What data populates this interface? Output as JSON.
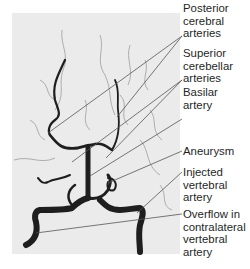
{
  "figure": {
    "image_description": "Cerebral angiogram (vertebral artery injection), grayscale",
    "background_color": "#ebebeb",
    "vessel_color": "#1a1a1a",
    "leader_line_color": "#555555",
    "labels": [
      {
        "id": "posterior-cerebral-arteries",
        "text": "Posterior\ncerebral\narteries",
        "top": 2
      },
      {
        "id": "superior-cerebellar-arteries",
        "text": "Superior\ncerebellar\narteries",
        "top": 47
      },
      {
        "id": "basilar-artery",
        "text": "Basilar\nartery",
        "top": 86
      },
      {
        "id": "aneurysm",
        "text": "Aneurysm",
        "top": 145
      },
      {
        "id": "injected-vertebral-artery",
        "text": "Injected\nvertebral\nartery",
        "top": 166
      },
      {
        "id": "overflow-contralateral-vertebral-artery",
        "text": "Overflow in\ncontralateral\nvertebral\nartery",
        "top": 208
      }
    ]
  }
}
